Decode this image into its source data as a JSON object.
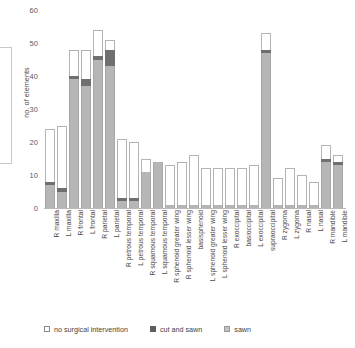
{
  "chart_data": {
    "type": "bar",
    "title": "",
    "xlabel": "",
    "ylabel": "no. of elements",
    "ylim": [
      0,
      60
    ],
    "yticks": [
      0,
      10,
      20,
      30,
      40,
      50,
      60
    ],
    "grid": false,
    "stacked": true,
    "legend_position": "bottom",
    "categories": [
      "R maxilla",
      "L maxilla",
      "R frontal",
      "L frontal",
      "R parietal",
      "L parietal",
      "R petrous temporal",
      "L petrous temporal",
      "R squamous temporal",
      "L squamous temporal",
      "R sphenoid greater wing",
      "R sphenoid lesser wing",
      "basisphenoid",
      "L sphenoid greater wing",
      "L sphenoid lesser wing",
      "R exoccipital",
      "basioccipital",
      "L exoccipital",
      "supraoccipital",
      "R zygoma",
      "L zygoma",
      "R nasal",
      "L nasal",
      "R mandible",
      "L mandible"
    ],
    "series": [
      {
        "name": "sawn",
        "color": "#b6b6b6",
        "values": [
          7,
          5,
          39,
          37,
          45,
          43,
          2,
          2,
          11,
          14,
          1,
          1,
          1,
          1,
          1,
          1,
          1,
          1,
          47,
          1,
          1,
          1,
          1,
          14,
          13
        ]
      },
      {
        "name": "cut and sawn",
        "color": "#6f6f6f",
        "values": [
          1,
          1,
          1,
          2,
          1,
          5,
          1,
          1,
          0,
          0,
          0,
          0,
          0,
          0,
          0,
          0,
          0,
          0,
          1,
          0,
          0,
          0,
          0,
          1,
          1
        ]
      },
      {
        "name": "no surgical intervention",
        "color": "#ffffff",
        "values": [
          16,
          19,
          8,
          9,
          8,
          3,
          18,
          17,
          4,
          0,
          12,
          13,
          15,
          11,
          11,
          11,
          11,
          12,
          5,
          8,
          11,
          9,
          7,
          4,
          2
        ]
      }
    ],
    "totals": [
      24,
      25,
      48,
      48,
      54,
      51,
      21,
      20,
      15,
      14,
      13,
      14,
      16,
      12,
      12,
      12,
      12,
      13,
      53,
      9,
      12,
      10,
      8,
      19,
      16
    ]
  },
  "legend": {
    "items": [
      {
        "label": "no surgical intervention",
        "swatch": "legend-swatch-no-intervention"
      },
      {
        "label": "cut and sawn",
        "swatch": "legend-swatch-cut-and-sawn"
      },
      {
        "label": "sawn",
        "swatch": "legend-swatch-sawn"
      }
    ]
  }
}
